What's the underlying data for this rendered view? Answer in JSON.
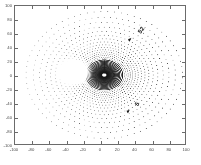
{
  "figure": {
    "background_color": "#ffffff",
    "axes_color": "#6b6b6b",
    "marker_color": "#1a1a1a"
  },
  "chart_data": {
    "type": "scatter",
    "title": "",
    "subtitle": "",
    "xlabel": "",
    "ylabel": "",
    "xlim": [
      -100,
      100
    ],
    "ylim": [
      -100,
      100
    ],
    "grid": false,
    "legend": null,
    "legend_position": "none",
    "marker": "filled-square-dot",
    "marker_color": "#1a1a1a",
    "xticks": [
      -100,
      -80,
      -60,
      -40,
      -20,
      0,
      20,
      40,
      60,
      80,
      100
    ],
    "xticklabels": [
      "-100",
      "-80",
      "-60",
      "-40",
      "-20",
      "0",
      "20",
      "40",
      "60",
      "80",
      "100"
    ],
    "yticks": [
      -100,
      -80,
      -60,
      -40,
      -20,
      0,
      20,
      40,
      60,
      80,
      100
    ],
    "yticklabels": [
      "-100",
      "-80",
      "-60",
      "-40",
      "-20",
      "0",
      "20",
      "40",
      "60",
      "80",
      "100"
    ],
    "pattern": {
      "center_x": 5,
      "center_y": 0,
      "n_spokes": 72,
      "n_rings": 46,
      "ring_radii_hint": "radii increase roughly geometrically from 3 to 92",
      "void_center_x": -32,
      "void_center_y": 4,
      "void_radius": 17
    },
    "annotations": [
      {
        "text": "52",
        "x": 46,
        "y": 66,
        "rotation": -55
      },
      {
        "text": "5",
        "x": 42,
        "y": -40,
        "rotation": -55
      }
    ],
    "arrow_markers": [
      {
        "x": 33,
        "y": 52,
        "direction": "down-left"
      },
      {
        "x": 31,
        "y": -52,
        "direction": "down-left"
      }
    ]
  }
}
